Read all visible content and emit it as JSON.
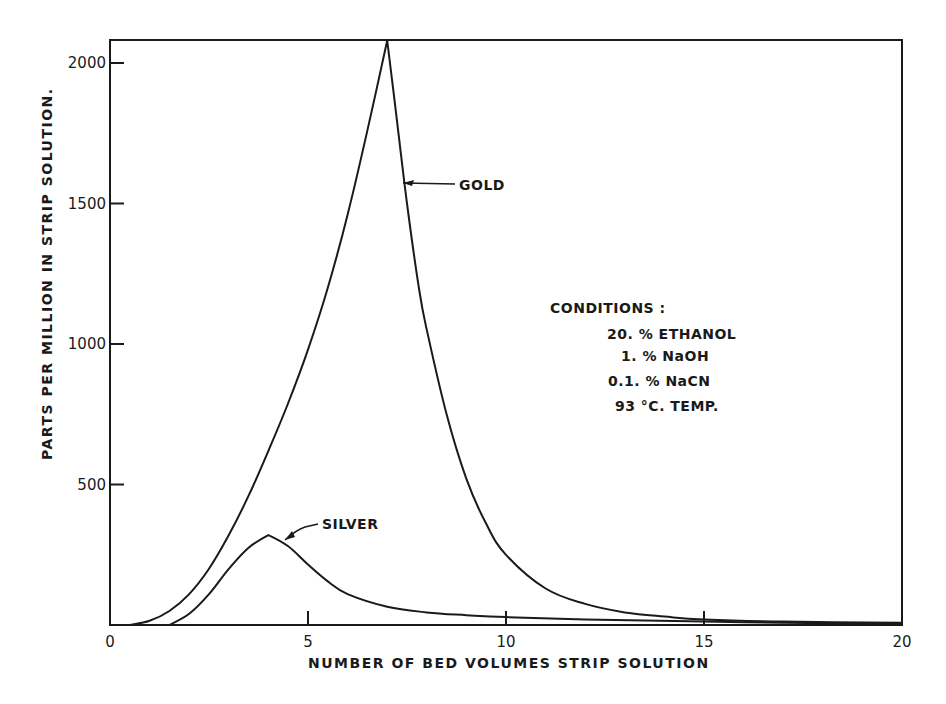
{
  "chart_data": {
    "type": "line",
    "title": "",
    "xlabel": "NUMBER OF BED VOLUMES STRIP SOLUTION",
    "ylabel": "PARTS PER MILLION IN STRIP SOLUTION.",
    "xlim": [
      0,
      20
    ],
    "ylim": [
      0,
      2080
    ],
    "x_ticks": [
      0,
      5,
      10,
      15,
      20
    ],
    "x_tick_labels": [
      "0",
      "5",
      "10",
      "15",
      "20"
    ],
    "y_ticks": [
      500,
      1000,
      1500,
      2000
    ],
    "y_tick_labels": [
      "500",
      "1000",
      "1500",
      "2000"
    ],
    "grid": false,
    "legend": "none (curves labelled directly)",
    "series": [
      {
        "name": "GOLD",
        "x": [
          0.5,
          1.0,
          1.5,
          2.0,
          2.5,
          3.0,
          3.5,
          4.0,
          4.5,
          5.0,
          5.5,
          6.0,
          6.5,
          7.0,
          7.2,
          7.5,
          7.8,
          8.0,
          8.5,
          9.0,
          9.5,
          10.0,
          11.0,
          12.0,
          13.0,
          14.0,
          15.0,
          17.0,
          20.0
        ],
        "values": [
          0,
          15,
          50,
          110,
          200,
          320,
          460,
          620,
          790,
          980,
          1200,
          1460,
          1760,
          2080,
          1850,
          1500,
          1200,
          1050,
          750,
          520,
          360,
          250,
          130,
          75,
          45,
          30,
          20,
          12,
          8
        ]
      },
      {
        "name": "SILVER",
        "x": [
          1.5,
          2.0,
          2.5,
          3.0,
          3.5,
          4.0,
          4.5,
          5.0,
          5.5,
          6.0,
          7.0,
          8.0,
          9.0,
          10.0,
          12.0,
          15.0,
          17.0,
          20.0
        ],
        "values": [
          0,
          40,
          110,
          200,
          275,
          320,
          280,
          215,
          155,
          110,
          65,
          45,
          35,
          28,
          20,
          12,
          8,
          5
        ]
      }
    ],
    "annotations": {
      "gold_label": "GOLD",
      "silver_label": "SILVER",
      "conditions_title": "CONDITIONS :",
      "conditions": [
        "20. % ETHANOL",
        "1. % NaOH",
        "0.1. % NaCN",
        "93 °C. TEMP."
      ]
    }
  },
  "layout": {
    "line_color": "#1a1a1a",
    "background": "#ffffff"
  }
}
